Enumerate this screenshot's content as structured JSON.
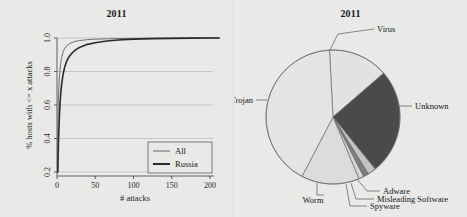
{
  "figure": {
    "background_color": "#e9e9e7",
    "panels": [
      "line-chart-panel",
      "pie-chart-panel"
    ]
  },
  "chart_data": [
    {
      "type": "line",
      "title": "2011",
      "xlabel": "# attacks",
      "ylabel": "% hosts with <= x attacks",
      "xlim": [
        0,
        215
      ],
      "ylim": [
        0.17,
        1.02
      ],
      "xticks": [
        0,
        50,
        100,
        150,
        200
      ],
      "xticklabels": [
        "0",
        "50",
        "100",
        "150",
        "200"
      ],
      "yticks": [
        0.2,
        0.4,
        0.6,
        0.8,
        1.0
      ],
      "yticklabels": [
        "0.2",
        "0.4",
        "0.6",
        "0.8",
        "1.0"
      ],
      "grid": "horizontal",
      "legend_position": "lower right",
      "series": [
        {
          "name": "All",
          "color": "#6f6f6f",
          "linewidth": 1.0,
          "x": [
            1,
            2,
            3,
            4,
            5,
            6,
            8,
            10,
            13,
            16,
            20,
            25,
            30,
            40,
            50,
            65,
            80,
            100,
            125,
            150,
            175,
            200,
            212
          ],
          "y": [
            0.49,
            0.66,
            0.755,
            0.815,
            0.855,
            0.882,
            0.917,
            0.937,
            0.955,
            0.965,
            0.974,
            0.981,
            0.985,
            0.99,
            0.993,
            0.995,
            0.997,
            0.998,
            0.999,
            0.999,
            1.0,
            1.0,
            1.0
          ]
        },
        {
          "name": "Russia",
          "color": "#2b2b2b",
          "linewidth": 1.6,
          "x": [
            1,
            2,
            3,
            4,
            5,
            6,
            8,
            10,
            13,
            16,
            20,
            25,
            30,
            40,
            50,
            65,
            80,
            100,
            125,
            150,
            175,
            200,
            212
          ],
          "y": [
            0.2,
            0.39,
            0.52,
            0.61,
            0.675,
            0.72,
            0.785,
            0.825,
            0.865,
            0.89,
            0.912,
            0.932,
            0.945,
            0.962,
            0.972,
            0.982,
            0.988,
            0.993,
            0.996,
            0.998,
            0.999,
            1.0,
            1.0
          ]
        }
      ],
      "legend": [
        {
          "label": "All",
          "color": "#6f6f6f",
          "linewidth": 1.0
        },
        {
          "label": "Russia",
          "color": "#2b2b2b",
          "linewidth": 1.8
        }
      ]
    },
    {
      "type": "pie",
      "title": "2011",
      "start_angle_deg": 93,
      "direction": "clockwise",
      "slices": [
        {
          "label": "Virus",
          "value": 14.5,
          "color": "#e2e2e0",
          "label_position": "top-right"
        },
        {
          "label": "Unknown",
          "value": 25.5,
          "color": "#4a4a4a",
          "label_position": "right"
        },
        {
          "label": "Adware",
          "value": 2.0,
          "color": "#c2c2c0",
          "label_position": "bottom-right"
        },
        {
          "label": "Misleading Software",
          "value": 1.3,
          "color": "#7d7d7b",
          "label_position": "bottom-right"
        },
        {
          "label": "Spyware",
          "value": 1.2,
          "color": "#d6d6d4",
          "label_position": "bottom-right"
        },
        {
          "label": "Worm",
          "value": 14.0,
          "color": "#dcdcda",
          "label_position": "bottom"
        },
        {
          "label": "Trojan",
          "value": 41.5,
          "color": "#e4e4e2",
          "label_position": "left"
        }
      ]
    }
  ],
  "line_chart": {
    "title": "2011",
    "xlabel": "# attacks",
    "ylabel": "% hosts with <= x attacks",
    "xticklabels": [
      "0",
      "50",
      "100",
      "150",
      "200"
    ],
    "yticklabels": [
      "0.2",
      "0.4",
      "0.6",
      "0.8",
      "1.0"
    ],
    "legend": {
      "all_label": "All",
      "russia_label": "Russia"
    }
  },
  "pie_chart": {
    "title": "2011",
    "labels": {
      "virus": "Virus",
      "unknown": "Unknown",
      "adware": "Adware",
      "misleading_software": "Misleading Software",
      "spyware": "Spyware",
      "worm": "Worm",
      "trojan": "Trojan"
    }
  }
}
